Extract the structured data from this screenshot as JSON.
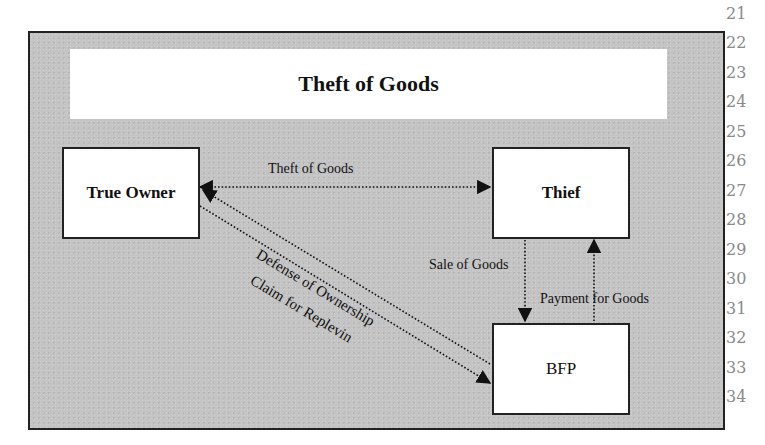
{
  "diagram": {
    "title": "Theft of Goods",
    "nodes": [
      {
        "id": "true-owner",
        "label": "True Owner"
      },
      {
        "id": "thief",
        "label": "Thief"
      },
      {
        "id": "bfp",
        "label": "BFP"
      }
    ],
    "edges": [
      {
        "from": "true-owner",
        "to": "thief",
        "label": "Theft of Goods",
        "style": "dotted",
        "direction": "both"
      },
      {
        "from": "bfp",
        "to": "true-owner",
        "label": "Defense of Ownership",
        "style": "dotted",
        "direction": "to-true-owner"
      },
      {
        "from": "true-owner",
        "to": "bfp",
        "label": "Claim for Replevin",
        "style": "dotted",
        "direction": "to-bfp"
      },
      {
        "from": "thief",
        "to": "bfp",
        "label": "Sale of Goods",
        "style": "dotted",
        "direction": "to-bfp"
      },
      {
        "from": "bfp",
        "to": "thief",
        "label": "Payment for Goods",
        "style": "dotted",
        "direction": "to-thief"
      }
    ],
    "colors": {
      "background": "#c4c4c4",
      "box": "#ffffff",
      "line": "#1a1a1a"
    }
  },
  "line_numbers": [
    "21",
    "22",
    "23",
    "24",
    "25",
    "26",
    "27",
    "28",
    "29",
    "30",
    "31",
    "32",
    "33",
    "34"
  ]
}
